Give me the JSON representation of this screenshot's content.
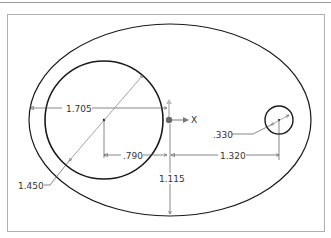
{
  "sketch": {
    "dimensions": {
      "large_circle_offset": "1.705",
      "large_circle_center_x": ".790",
      "small_circle_center_x": "1.320",
      "small_circle_diameter": ".330",
      "large_circle_diameter": "1.450",
      "ellipse_half_height": "1.115"
    },
    "axis": {
      "x_label": "X"
    }
  },
  "colors": {
    "geometry": "#1a1a1a",
    "dimension": "#555555",
    "axis": "#7a7a7a",
    "frame": "#b0b0b0"
  }
}
